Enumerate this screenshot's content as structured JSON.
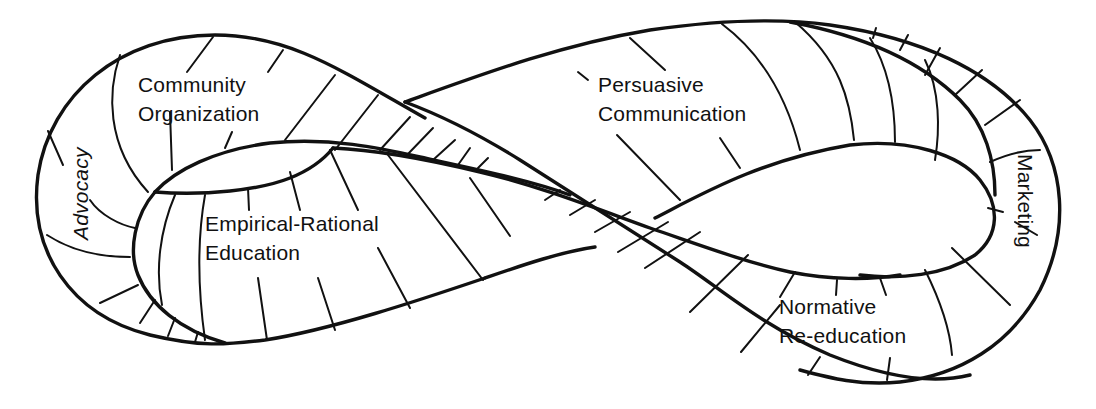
{
  "diagram": {
    "type": "mobius-strip",
    "stroke_color": "#111111",
    "background": "#ffffff",
    "labels": {
      "community_organization": {
        "line1": "Community",
        "line2": "Organization"
      },
      "advocacy": {
        "text": "Advocacy"
      },
      "empirical_rational": {
        "line1": "Empirical-Rational",
        "line2": "Education"
      },
      "persuasive": {
        "line1": "Persuasive",
        "line2": "Communication"
      },
      "marketing": {
        "text": "Marketing"
      },
      "normative": {
        "line1": "Normative",
        "line2": "Re-education"
      }
    }
  }
}
